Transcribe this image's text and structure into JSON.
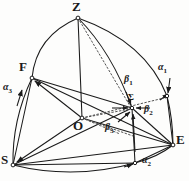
{
  "figure": {
    "type": "spherical-triangle-diagram",
    "width": 189,
    "height": 181,
    "background": "#fdfdfc",
    "ink_color": "#1a1a1a"
  },
  "vertices": [
    {
      "id": "Z",
      "label": "Z",
      "x": 78,
      "y": 18,
      "label_x": 72,
      "label_y": 1,
      "role": "apex-zenith"
    },
    {
      "id": "F",
      "label": "F",
      "x": 32,
      "y": 78,
      "label_x": 20,
      "label_y": 62,
      "role": "left-upper-vertex"
    },
    {
      "id": "S",
      "label": "S",
      "x": 13,
      "y": 165,
      "label_x": 2,
      "label_y": 155,
      "role": "bottom-left-vertex"
    },
    {
      "id": "E",
      "label": "E",
      "x": 173,
      "y": 145,
      "label_x": 176,
      "label_y": 135,
      "role": "right-vertex"
    },
    {
      "id": "O",
      "label": "O",
      "x": 82,
      "y": 118,
      "label_x": 74,
      "label_y": 120,
      "role": "sphere-center-origin"
    },
    {
      "id": "Sigma",
      "label": "Σ",
      "x": 132,
      "y": 108,
      "label_x": 132,
      "label_y": 95,
      "role": "resultant-point"
    }
  ],
  "arc_points": [
    {
      "id": "A1",
      "x": 167,
      "y": 96,
      "role": "alpha1-arc-endpoint"
    },
    {
      "id": "A2",
      "x": 135,
      "y": 163,
      "role": "alpha2-arc-point"
    }
  ],
  "angle_labels": [
    {
      "id": "alpha1",
      "base": "α",
      "sub": "1",
      "x": 160,
      "y": 68,
      "on": "arc Z to right limb"
    },
    {
      "id": "alpha2",
      "base": "α",
      "sub": "2",
      "x": 143,
      "y": 161,
      "on": "bottom arc S to E"
    },
    {
      "id": "alpha3",
      "base": "α",
      "sub": "3",
      "x": 4,
      "y": 88,
      "on": "left arc S to F"
    },
    {
      "id": "beta1",
      "base": "β",
      "sub": "1",
      "x": 126,
      "y": 80,
      "on": "upper ray into Sigma"
    },
    {
      "id": "beta2",
      "base": "β",
      "sub": "2",
      "x": 145,
      "y": 110,
      "on": "right ray into Sigma"
    },
    {
      "id": "beta3",
      "base": "β",
      "sub": "3",
      "x": 107,
      "y": 128,
      "on": "lower-left ray into Sigma"
    }
  ],
  "arcs": [
    {
      "id": "arc-Z-F",
      "from": "Z",
      "to": "F",
      "style": "solid",
      "note": "great circle arc, bulges left"
    },
    {
      "id": "arc-F-S",
      "from": "F",
      "to": "S",
      "style": "solid",
      "note": "left limb arc, carries alpha3"
    },
    {
      "id": "arc-S-E",
      "from": "S",
      "to": "E",
      "style": "solid",
      "note": "bottom limb arc through alpha2"
    },
    {
      "id": "arc-Z-E",
      "from": "Z",
      "to": "E",
      "style": "solid",
      "note": "right limb arc through alpha1"
    },
    {
      "id": "arc-Z-Sigma",
      "from": "Z",
      "to": "Sigma",
      "style": "solid",
      "note": "inner great circle arc to Sigma"
    }
  ],
  "chords": [
    {
      "id": "chord-Z-O",
      "from": "Z",
      "to": "O",
      "style": "solid"
    },
    {
      "id": "chord-F-S",
      "from": "F",
      "to": "S",
      "style": "solid"
    },
    {
      "id": "chord-S-E",
      "from": "S",
      "to": "E",
      "style": "solid"
    },
    {
      "id": "chord-F-E",
      "from": "F",
      "to": "E",
      "style": "solid"
    },
    {
      "id": "chord-O-F",
      "from": "O",
      "to": "F",
      "style": "solid"
    },
    {
      "id": "chord-O-S",
      "from": "O",
      "to": "S",
      "style": "solid"
    },
    {
      "id": "chord-O-E",
      "from": "O",
      "to": "E",
      "style": "solid"
    },
    {
      "id": "chord-S-A2",
      "from": "S",
      "to": "A2",
      "style": "solid"
    },
    {
      "id": "chord-A2-E",
      "from": "A2",
      "to": "E",
      "style": "solid"
    },
    {
      "id": "chord-Sigma-E",
      "from": "Sigma",
      "to": "E",
      "style": "solid"
    },
    {
      "id": "chord-Sigma-A2",
      "from": "Sigma",
      "to": "A2",
      "style": "solid"
    },
    {
      "id": "chord-Sigma-A1",
      "from": "Sigma",
      "to": "A1",
      "style": "solid"
    },
    {
      "id": "chord-A1-E",
      "from": "A1",
      "to": "E",
      "style": "solid"
    },
    {
      "id": "chord-F-Sigma",
      "from": "F",
      "to": "Sigma",
      "style": "solid"
    }
  ],
  "dotted_rays": [
    {
      "id": "dot-O-Sigma",
      "from": "O",
      "to": "Sigma",
      "style": "dotted"
    },
    {
      "id": "dot-O-upper",
      "from": "O",
      "to": "A1",
      "style": "dotted"
    },
    {
      "id": "dot-O-lower",
      "from": "O",
      "to": "A2",
      "style": "dotted"
    },
    {
      "id": "dot-Z-Sigma",
      "from": "Z",
      "to": "Sigma",
      "style": "dotted"
    }
  ],
  "arrows": [
    {
      "id": "arrow-alpha3",
      "at": "left arc near alpha3",
      "direction": "up"
    },
    {
      "id": "arrow-alpha1",
      "at": "right arc near alpha1",
      "direction": "down"
    },
    {
      "id": "arrow-alpha2",
      "at": "bottom arc near alpha2",
      "direction": "right"
    },
    {
      "id": "arrow-beta1",
      "at": "Sigma from above",
      "direction": "down-left"
    },
    {
      "id": "arrow-beta2",
      "at": "Sigma from right",
      "direction": "left"
    },
    {
      "id": "arrow-beta3",
      "at": "Sigma from below-left",
      "direction": "up-right"
    },
    {
      "id": "arrow-to-F",
      "at": "F from center",
      "direction": "up-left"
    },
    {
      "id": "arrow-to-S",
      "at": "S from center",
      "direction": "down-left"
    }
  ]
}
